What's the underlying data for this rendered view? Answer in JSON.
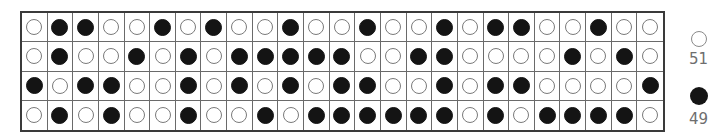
{
  "grid": {
    "rows": 4,
    "columns": 25,
    "cells": [
      [
        "white",
        "black",
        "black",
        "white",
        "white",
        "black",
        "white",
        "black",
        "white",
        "white",
        "black",
        "white",
        "white",
        "black",
        "white",
        "white",
        "black",
        "white",
        "black",
        "black",
        "white",
        "white",
        "black",
        "white",
        "white"
      ],
      [
        "white",
        "black",
        "white",
        "white",
        "black",
        "white",
        "black",
        "white",
        "black",
        "black",
        "black",
        "black",
        "black",
        "white",
        "white",
        "black",
        "black",
        "white",
        "white",
        "white",
        "white",
        "black",
        "white",
        "black",
        "white"
      ],
      [
        "black",
        "white",
        "black",
        "black",
        "white",
        "white",
        "black",
        "white",
        "black",
        "white",
        "black",
        "white",
        "black",
        "black",
        "white",
        "white",
        "black",
        "white",
        "black",
        "black",
        "white",
        "white",
        "white",
        "white",
        "black"
      ],
      [
        "white",
        "black",
        "white",
        "black",
        "white",
        "white",
        "black",
        "white",
        "white",
        "black",
        "white",
        "black",
        "black",
        "black",
        "black",
        "black",
        "black",
        "white",
        "black",
        "white",
        "black",
        "black",
        "black",
        "black",
        "white"
      ]
    ],
    "colors": {
      "white_fill": "#ffffff",
      "white_stroke": "#7a7a7a",
      "black_fill": "#141414",
      "grid_line": "#6a6a6a",
      "border": "#3a3a3a"
    }
  },
  "legend": {
    "items": [
      {
        "kind": "white",
        "icon": "white-circle-icon",
        "count": "51"
      },
      {
        "kind": "black",
        "icon": "black-circle-icon",
        "count": "49"
      }
    ],
    "text_color": "#6e6e6e"
  }
}
